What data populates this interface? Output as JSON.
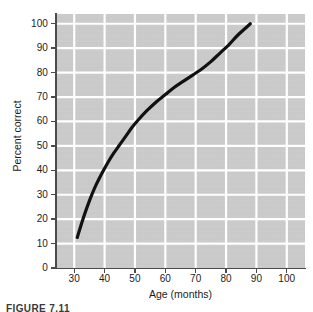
{
  "figure": {
    "caption": "FIGURE 7.11"
  },
  "chart_data": {
    "type": "line",
    "title": "",
    "subtitle": "",
    "xlabel": "Age (months)",
    "ylabel": "Percent correct",
    "xlim": [
      24,
      106
    ],
    "ylim": [
      0,
      104
    ],
    "xticks": [
      30,
      40,
      50,
      60,
      70,
      80,
      90,
      100
    ],
    "xtick_labels": [
      "30",
      "40",
      "50",
      "60",
      "70",
      "80",
      "90",
      "100"
    ],
    "yticks": [
      0,
      10,
      20,
      30,
      40,
      50,
      60,
      70,
      80,
      90,
      100
    ],
    "ytick_labels": [
      "0",
      "10",
      "20",
      "30",
      "40",
      "50",
      "60",
      "70",
      "80",
      "90",
      "100"
    ],
    "grid": true,
    "grid_color": "#ffffff",
    "plot_background": "#c9c9c9",
    "legend": null,
    "legend_position": "none",
    "series": [
      {
        "name": "Percent correct by age",
        "color": "#111111",
        "line_width": 3.2,
        "markers": false,
        "x": [
          31,
          33,
          35,
          37,
          39,
          41,
          43,
          45,
          47,
          49,
          51,
          54,
          57,
          60,
          63,
          66,
          69,
          72,
          75,
          78,
          81,
          84,
          88
        ],
        "y": [
          12.5,
          20.5,
          27.5,
          33.5,
          38.5,
          43.0,
          47.0,
          50.5,
          54.0,
          57.5,
          60.5,
          64.5,
          68.0,
          71.0,
          74.0,
          76.5,
          79.0,
          81.5,
          84.5,
          88.0,
          91.5,
          95.5,
          100.0
        ]
      }
    ]
  }
}
